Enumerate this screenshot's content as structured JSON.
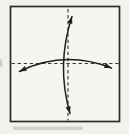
{
  "colors": {
    "page_background": "#f2f1ed",
    "paper_fill": "#f6f5f1",
    "outline": "#2b2b2b",
    "crease": "#3a3a3a",
    "arrow": "#1f1f1f",
    "artifact": "#b9b7b1"
  },
  "canvas": {
    "width": 129,
    "height": 134
  },
  "paper": {
    "name": "origami-square-sheet",
    "x": 10.5,
    "y": 6.5,
    "width": 109,
    "height": 115,
    "stroke_width": 1.7
  },
  "creases": [
    {
      "name": "horizontal-valley-crease",
      "x1": 11.5,
      "y1": 63.5,
      "x2": 119,
      "y2": 63.5,
      "dash": "3.4 2.7",
      "stroke_width": 1.15
    },
    {
      "name": "vertical-valley-crease",
      "x1": 68,
      "y1": 9,
      "x2": 68,
      "y2": 120.5,
      "dash": "3.4 2.7",
      "stroke_width": 1.15
    }
  ],
  "arrows": [
    {
      "name": "fold-unfold-arrow-vertical",
      "p0": [
        72,
        16.5
      ],
      "c": [
        56,
        65
      ],
      "p2": [
        70,
        113.5
      ],
      "stroke_width": 1.5,
      "head_length": 7,
      "head_half_width": 2.6
    },
    {
      "name": "fold-unfold-arrow-horizontal",
      "p0": [
        19.5,
        71.5
      ],
      "c": [
        64,
        49.5
      ],
      "p2": [
        111.5,
        68
      ],
      "stroke_width": 1.5,
      "head_length": 7,
      "head_half_width": 2.6
    }
  ],
  "artifacts": [
    {
      "name": "scan-smudge-bottom",
      "x": 13,
      "y": 126.5,
      "width": 70,
      "height": 3.4,
      "opacity": 0.55
    },
    {
      "name": "scan-mark-left-edge",
      "x": 0,
      "y": 59,
      "width": 2.2,
      "height": 8,
      "opacity": 0.6
    }
  ]
}
